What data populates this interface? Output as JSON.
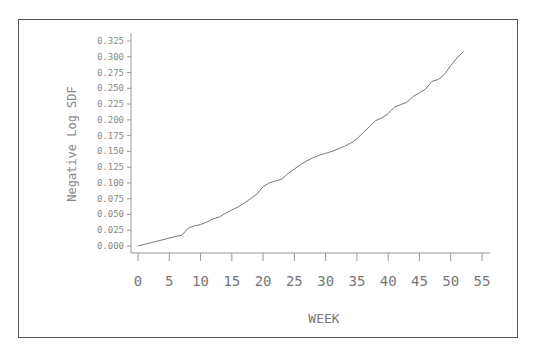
{
  "chart_data": {
    "type": "line",
    "title": "",
    "xlabel": "WEEK",
    "ylabel": "Negative Log SDF",
    "xlim": [
      0,
      55
    ],
    "ylim": [
      0,
      0.325
    ],
    "x_ticks": [
      0,
      5,
      10,
      15,
      20,
      25,
      30,
      35,
      40,
      45,
      50,
      55
    ],
    "x_tick_labels": [
      "0",
      "5",
      "10",
      "15",
      "20",
      "25",
      "30",
      "35",
      "40",
      "45",
      "50",
      "55"
    ],
    "y_ticks": [
      0,
      0.025,
      0.05,
      0.075,
      0.1,
      0.125,
      0.15,
      0.175,
      0.2,
      0.225,
      0.25,
      0.275,
      0.3,
      0.325
    ],
    "y_tick_labels": [
      "0.000",
      "0.025",
      "0.050",
      "0.075",
      "0.100",
      "0.125",
      "0.150",
      "0.175",
      "0.200",
      "0.225",
      "0.250",
      "0.275",
      "0.300",
      "0.325"
    ],
    "grid": false,
    "legend": null,
    "series": [
      {
        "name": "Negative Log SDF",
        "x": [
          0,
          2,
          4,
          6,
          7,
          8,
          9,
          10,
          11,
          12,
          13,
          14,
          15,
          16,
          17,
          18,
          19,
          20,
          21,
          22,
          23,
          24,
          25,
          26,
          27,
          28,
          29,
          30,
          31,
          32,
          33,
          34,
          35,
          36,
          37,
          38,
          39,
          40,
          41,
          42,
          43,
          44,
          45,
          46,
          47,
          48,
          49,
          50,
          51,
          52
        ],
        "values": [
          0.0,
          0.005,
          0.01,
          0.015,
          0.017,
          0.028,
          0.032,
          0.034,
          0.038,
          0.043,
          0.046,
          0.052,
          0.057,
          0.062,
          0.068,
          0.075,
          0.082,
          0.094,
          0.1,
          0.103,
          0.106,
          0.115,
          0.122,
          0.129,
          0.135,
          0.14,
          0.144,
          0.147,
          0.15,
          0.154,
          0.158,
          0.163,
          0.17,
          0.18,
          0.189,
          0.199,
          0.203,
          0.21,
          0.22,
          0.224,
          0.228,
          0.237,
          0.243,
          0.249,
          0.261,
          0.264,
          0.272,
          0.286,
          0.298,
          0.308
        ]
      }
    ]
  },
  "labels": {
    "xlabel": "WEEK",
    "ylabel": "Negative Log SDF"
  }
}
